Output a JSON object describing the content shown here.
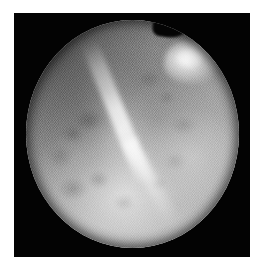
{
  "figure": {
    "kind": "endoscopic-still-image",
    "modality_label": "fiberoptic endoscopy",
    "color_mode": "grayscale",
    "caption": "",
    "dimensions": {
      "width_px": 262,
      "height_px": 273
    }
  },
  "frame": {
    "name": "capture-frame",
    "background_color": "#030303",
    "left_px": 14,
    "top_px": 13,
    "width_px": 236,
    "height_px": 244
  },
  "field_of_view": {
    "shape": "circle",
    "left_px": 26,
    "top_px": 20,
    "width_px": 213,
    "height_px": 228,
    "rim_notch": "top-right"
  },
  "features": [
    {
      "name": "specular-ridge",
      "description": "bright linear tissue fold running from upper-left toward lower-right, curving",
      "brightness": "#ffffff"
    },
    {
      "name": "bright-lesion",
      "description": "rounded bright bulbous structure at upper-right of the field of view",
      "brightness": "#f2f2f2"
    },
    {
      "name": "mottled-tissue",
      "description": "diffuse darker blotches across the mucosal surface",
      "brightness": "#4a4a4a"
    },
    {
      "name": "fiber-bundle-mesh",
      "description": "fine crosshatch honeycomb pattern from the fiberscope image guide",
      "brightness": "#000000"
    },
    {
      "name": "peripheral-vignette",
      "description": "darkening toward the circular rim and upper-left quadrant",
      "brightness": "#1a1a1a"
    }
  ],
  "palette": {
    "page_background": "#ffffff",
    "frame_black": "#030303",
    "tissue_mid_gray": "#9a9a9a",
    "tissue_light_gray": "#c9c9c9",
    "tissue_dark_gray": "#6e6e6e",
    "highlight_white": "#ffffff"
  }
}
